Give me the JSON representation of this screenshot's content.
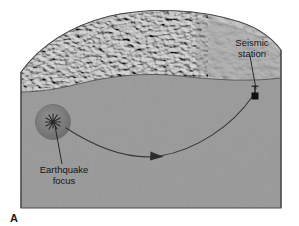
{
  "figure": {
    "part_label": "A",
    "type": "block-diagram"
  },
  "annotations": {
    "seismic_station": {
      "line1": "Seismic",
      "line2": "station",
      "marker_icon": "seismic-station-icon"
    },
    "earthquake_focus": {
      "line1": "Earthquake",
      "line2": "focus",
      "marker_icon": "earthquake-focus-starburst-icon"
    }
  },
  "colors": {
    "page_background": "#ffffff",
    "block_body": "#9a9a9a",
    "block_body_dark": "#8d8d8d",
    "terrain_light": "#c8c8c8",
    "terrain_mid": "#a9a9a9",
    "terrain_dark": "#7e7e7e",
    "outline": "#4a4a4a",
    "ray_path": "#3a3a3a",
    "focus_sphere": "#7a7a7a",
    "marker_black": "#111111",
    "label_text": "#151515"
  },
  "geometry": {
    "block_left": 21,
    "block_right": 281,
    "block_bottom": 208,
    "surface_line_note": "undulating ground surface separating textured relief top from smooth cross-section face",
    "focus_center": [
      53,
      122
    ],
    "focus_radius": 17,
    "station_marker": [
      255,
      95
    ],
    "ray_arrow_tip": [
      160,
      156
    ]
  }
}
